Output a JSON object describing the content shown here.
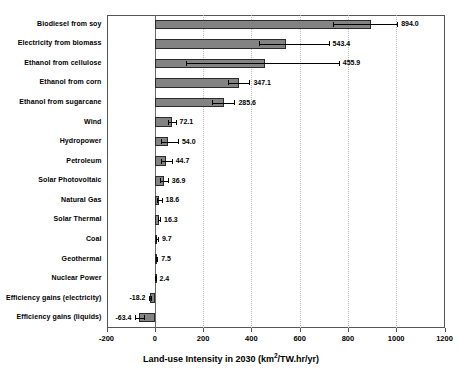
{
  "chart_data": {
    "type": "bar",
    "orientation": "horizontal",
    "title": "",
    "xlabel": "Land-use Intensity in 2030 (km²/TW.hr/yr)",
    "xlabel_prefix": "Land-use Intensity in 2030 (km",
    "xlabel_sup": "2",
    "xlabel_suffix": "/TW.hr/yr)",
    "ylabel": "",
    "xlim": [
      -200,
      1200
    ],
    "xticks": [
      -200,
      0,
      200,
      400,
      600,
      800,
      1000,
      1200
    ],
    "xtick_labels": [
      "-200",
      "0",
      "200",
      "400",
      "600",
      "800",
      "1000",
      "1200"
    ],
    "grid": "vertical-dotted",
    "legend": "none",
    "bar_color": "#838383",
    "bar_border_color": "#2b2b2b",
    "error_bar_color": "#000000",
    "categories": [
      "Biodiesel from soy",
      "Electricity from biomass",
      "Ethanol from cellulose",
      "Ethanol from corn",
      "Ethanol from sugarcane",
      "Wind",
      "Hydropower",
      "Petroleum",
      "Solar Photovoltaic",
      "Natural Gas",
      "Solar Thermal",
      "Coal",
      "Geothermal",
      "Nuclear Power",
      "Efficiency gains (electricity)",
      "Efficiency gains (liquids)"
    ],
    "values": [
      894.0,
      543.4,
      455.9,
      347.1,
      285.6,
      72.1,
      54.0,
      44.7,
      36.9,
      18.6,
      16.3,
      9.7,
      7.5,
      2.4,
      -18.2,
      -63.4
    ],
    "value_labels": [
      "894.0",
      "543.4",
      "455.9",
      "347.1",
      "285.6",
      "72.1",
      "54.0",
      "44.7",
      "36.9",
      "18.6",
      "16.3",
      "9.7",
      "7.5",
      "2.4",
      "-18.2",
      "-63.4"
    ],
    "error_low": [
      740,
      432,
      128,
      305,
      238,
      56,
      27,
      25,
      20,
      10,
      12,
      7,
      5,
      2,
      -22,
      -80
    ],
    "error_high": [
      1004,
      720,
      762,
      392,
      330,
      86,
      96,
      70,
      54,
      28,
      22,
      13,
      10,
      3,
      -14,
      -46
    ]
  }
}
